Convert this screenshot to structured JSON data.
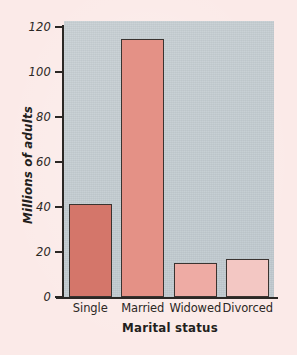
{
  "figure": {
    "page_background": "#fbeae8",
    "plot_background": "#c3ccd1",
    "axis_color": "#2b2724"
  },
  "chart_data": {
    "type": "bar",
    "title": "",
    "xlabel": "Marital status",
    "ylabel": "Millions of adults",
    "categories": [
      "Single",
      "Married",
      "Widowed",
      "Divorced"
    ],
    "values": [
      41.5,
      114.5,
      15,
      17
    ],
    "ylim": [
      0,
      120
    ],
    "yticks": [
      0,
      20,
      40,
      60,
      80,
      100,
      120
    ],
    "ytick_labels": [
      "0",
      "20",
      "40",
      "60",
      "80",
      "100",
      "120"
    ],
    "grid": false,
    "legend": null,
    "bar_colors": [
      "#d4766a",
      "#e49186",
      "#eeaba4",
      "#f3c7c3"
    ],
    "bar_edge_color": "#3a3330"
  }
}
